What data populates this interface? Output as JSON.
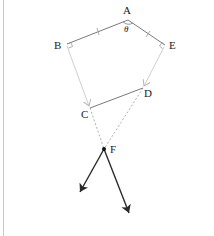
{
  "diagram": {
    "type": "geometry-vector-diagram",
    "points": {
      "A": {
        "label": "A",
        "x": 128,
        "y": 20,
        "lx": 127,
        "ly": 12
      },
      "B": {
        "label": "B",
        "x": 67,
        "y": 44,
        "lx": 58,
        "ly": 48
      },
      "E": {
        "label": "E",
        "x": 165,
        "y": 45,
        "lx": 173,
        "ly": 49
      },
      "D": {
        "label": "D",
        "x": 143,
        "y": 88,
        "lx": 148,
        "ly": 97
      },
      "C": {
        "label": "C",
        "x": 90,
        "y": 108,
        "lx": 84,
        "ly": 118
      },
      "F": {
        "label": "F",
        "x": 104,
        "y": 149,
        "lx": 114,
        "ly": 153
      }
    },
    "angle_label": {
      "text": "θ",
      "x": 126,
      "y": 32
    },
    "segments": [
      {
        "from": "B",
        "to": "A",
        "style": "solid",
        "color": "#7a7a7a",
        "tick": "single"
      },
      {
        "from": "A",
        "to": "E",
        "style": "solid",
        "color": "#7a7a7a",
        "tick": "single"
      },
      {
        "from": "C",
        "to": "D",
        "style": "solid",
        "color": "#7a7a7a"
      },
      {
        "from": "B",
        "to": "C",
        "style": "arrow",
        "color": "#cfcfcf"
      },
      {
        "from": "E",
        "to": "D",
        "style": "arrow",
        "color": "#cfcfcf"
      },
      {
        "from": "C",
        "to": "F",
        "style": "dashed",
        "color": "#9a9a9a"
      },
      {
        "from": "D",
        "to": "F",
        "style": "dashed",
        "color": "#9a9a9a"
      }
    ],
    "force_arrows": [
      {
        "name": "force-left",
        "from": [
          104,
          149
        ],
        "to": [
          80,
          192
        ],
        "color": "#2a2a2a"
      },
      {
        "name": "force-right",
        "from": [
          104,
          149
        ],
        "to": [
          129,
          213
        ],
        "color": "#2a2a2a"
      }
    ],
    "right_angle_markers": [
      "B",
      "E"
    ],
    "colors": {
      "light_line": "#cfcfcf",
      "mid_line": "#7a7a7a",
      "dark_line": "#2a2a2a",
      "dashed": "#9a9a9a",
      "border": "#c8c8c8"
    }
  }
}
